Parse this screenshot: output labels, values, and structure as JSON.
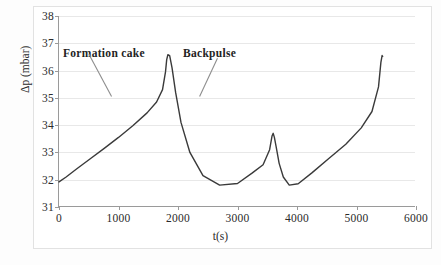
{
  "figure": {
    "background": "#ffffff",
    "frame_color": "#e2e2e2",
    "axis_color": "#9a9a9a",
    "grid_color": "#e8e8e8",
    "curve_color": "#3a3a3a",
    "leader_color": "#8d8d8d"
  },
  "annotations": {
    "formation_cake": "Formation cake",
    "backpulse": "Backpulse"
  },
  "axes": {
    "ylabel": "Δp (mbar)",
    "xlabel": "t(s)",
    "yticks": [
      "31",
      "32",
      "33",
      "34",
      "35",
      "36",
      "37",
      "38"
    ],
    "xticks": [
      "0",
      "1000",
      "2000",
      "3000",
      "4000",
      "5000",
      "6000"
    ]
  },
  "chart_data": {
    "type": "line",
    "title": "",
    "xlabel": "t(s)",
    "ylabel": "Δp (mbar)",
    "xlim": [
      0,
      6000
    ],
    "ylim": [
      31,
      38
    ],
    "xticks": [
      0,
      1000,
      2000,
      3000,
      4000,
      5000,
      6000
    ],
    "yticks": [
      31,
      32,
      33,
      34,
      35,
      36,
      37,
      38
    ],
    "grid": "horizontal",
    "legend": "none",
    "annotations": [
      {
        "text": "Formation cake",
        "x": 330,
        "y": 36.85,
        "leader_from": [
          520,
          36.6
        ],
        "leader_to": [
          900,
          35.05
        ]
      },
      {
        "text": "Backpulse",
        "x": 2440,
        "y": 36.85,
        "leader_from": [
          2680,
          36.45
        ],
        "leader_to": [
          2380,
          35.05
        ]
      }
    ],
    "series": [
      {
        "name": "Δp",
        "x": [
          0,
          120,
          300,
          520,
          760,
          1000,
          1240,
          1480,
          1640,
          1740,
          1790,
          1810,
          1830,
          1860,
          1900,
          1960,
          2050,
          2200,
          2420,
          2700,
          3000,
          3250,
          3430,
          3540,
          3580,
          3600,
          3620,
          3650,
          3700,
          3770,
          3870,
          4020,
          4250,
          4520,
          4820,
          5080,
          5260,
          5370,
          5410,
          5430,
          5440
        ],
        "y": [
          31.92,
          32.1,
          32.4,
          32.76,
          33.15,
          33.55,
          33.98,
          34.45,
          34.85,
          35.3,
          35.95,
          36.4,
          36.58,
          36.55,
          36.1,
          35.2,
          34.1,
          33.0,
          32.15,
          31.8,
          31.86,
          32.25,
          32.55,
          33.1,
          33.6,
          33.7,
          33.55,
          33.2,
          32.6,
          32.1,
          31.8,
          31.85,
          32.25,
          32.75,
          33.3,
          33.9,
          34.5,
          35.4,
          36.3,
          36.55,
          36.52
        ]
      }
    ],
    "cycles": [
      {
        "start_s": 0,
        "peak_s": 1830,
        "peak_mbar": 36.58,
        "trough_mbar": 31.8
      },
      {
        "start_s": 1850,
        "peak_s": 3600,
        "peak_mbar": 36.55,
        "trough_mbar": 31.78
      },
      {
        "start_s": 3660,
        "peak_s": 5430,
        "peak_mbar": 36.55,
        "trough_mbar": 31.32
      }
    ]
  }
}
